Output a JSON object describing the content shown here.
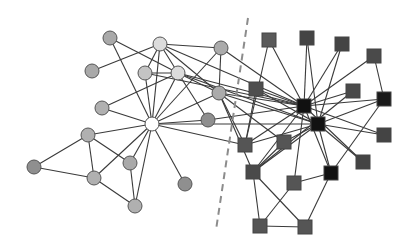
{
  "diagram": {
    "type": "network-graph",
    "width": 413,
    "height": 251,
    "divider": {
      "x1": 248,
      "y1": 18,
      "x2": 216,
      "y2": 230,
      "style": "dashed",
      "color": "#8c8c8c"
    },
    "groups": [
      {
        "name": "circle-group",
        "shape": "circle"
      },
      {
        "name": "square-group",
        "shape": "square"
      }
    ],
    "nodes": [
      {
        "id": "C1",
        "shape": "circle",
        "x": 110,
        "y": 38,
        "r": 7,
        "fill": "#a9a9a9"
      },
      {
        "id": "C2",
        "shape": "circle",
        "x": 160,
        "y": 44,
        "r": 7,
        "fill": "#dcdcdc"
      },
      {
        "id": "C3",
        "shape": "circle",
        "x": 92,
        "y": 71,
        "r": 7,
        "fill": "#a9a9a9"
      },
      {
        "id": "C4",
        "shape": "circle",
        "x": 145,
        "y": 73,
        "r": 7,
        "fill": "#c4c4c4"
      },
      {
        "id": "C5",
        "shape": "circle",
        "x": 178,
        "y": 73,
        "r": 7,
        "fill": "#dcdcdc"
      },
      {
        "id": "C6",
        "shape": "circle",
        "x": 221,
        "y": 48,
        "r": 7,
        "fill": "#ababab"
      },
      {
        "id": "C7",
        "shape": "circle",
        "x": 102,
        "y": 108,
        "r": 7,
        "fill": "#b0b0b0"
      },
      {
        "id": "C8",
        "shape": "circle",
        "x": 152,
        "y": 124,
        "r": 7,
        "fill": "#ffffff"
      },
      {
        "id": "C9",
        "shape": "circle",
        "x": 208,
        "y": 120,
        "r": 7,
        "fill": "#8f8f8f"
      },
      {
        "id": "C10",
        "shape": "circle",
        "x": 219,
        "y": 93,
        "r": 7,
        "fill": "#ababab"
      },
      {
        "id": "C11",
        "shape": "circle",
        "x": 88,
        "y": 135,
        "r": 7,
        "fill": "#b0b0b0"
      },
      {
        "id": "C12",
        "shape": "circle",
        "x": 34,
        "y": 167,
        "r": 7,
        "fill": "#8f8f8f"
      },
      {
        "id": "C13",
        "shape": "circle",
        "x": 94,
        "y": 178,
        "r": 7,
        "fill": "#b0b0b0"
      },
      {
        "id": "C14",
        "shape": "circle",
        "x": 130,
        "y": 163,
        "r": 7,
        "fill": "#a9a9a9"
      },
      {
        "id": "C15",
        "shape": "circle",
        "x": 135,
        "y": 206,
        "r": 7,
        "fill": "#b0b0b0"
      },
      {
        "id": "C16",
        "shape": "circle",
        "x": 185,
        "y": 184,
        "r": 7,
        "fill": "#8f8f8f"
      },
      {
        "id": "S1",
        "shape": "square",
        "x": 269,
        "y": 40,
        "s": 14,
        "fill": "#5a5a5a"
      },
      {
        "id": "S2",
        "shape": "square",
        "x": 307,
        "y": 38,
        "s": 14,
        "fill": "#444444"
      },
      {
        "id": "S3",
        "shape": "square",
        "x": 342,
        "y": 44,
        "s": 14,
        "fill": "#444444"
      },
      {
        "id": "S4",
        "shape": "square",
        "x": 374,
        "y": 56,
        "s": 14,
        "fill": "#4a4a4a"
      },
      {
        "id": "S5",
        "shape": "square",
        "x": 256,
        "y": 89,
        "s": 14,
        "fill": "#4e4e4e"
      },
      {
        "id": "S6",
        "shape": "square",
        "x": 304,
        "y": 106,
        "s": 14,
        "fill": "#111111"
      },
      {
        "id": "S7",
        "shape": "square",
        "x": 318,
        "y": 124,
        "s": 14,
        "fill": "#111111"
      },
      {
        "id": "S8",
        "shape": "square",
        "x": 353,
        "y": 91,
        "s": 14,
        "fill": "#4a4a4a"
      },
      {
        "id": "S9",
        "shape": "square",
        "x": 384,
        "y": 99,
        "s": 14,
        "fill": "#1a1a1a"
      },
      {
        "id": "S10",
        "shape": "square",
        "x": 245,
        "y": 145,
        "s": 14,
        "fill": "#555555"
      },
      {
        "id": "S11",
        "shape": "square",
        "x": 284,
        "y": 142,
        "s": 14,
        "fill": "#555555"
      },
      {
        "id": "S12",
        "shape": "square",
        "x": 384,
        "y": 135,
        "s": 14,
        "fill": "#444444"
      },
      {
        "id": "S13",
        "shape": "square",
        "x": 363,
        "y": 162,
        "s": 14,
        "fill": "#444444"
      },
      {
        "id": "S14",
        "shape": "square",
        "x": 253,
        "y": 172,
        "s": 14,
        "fill": "#4a4a4a"
      },
      {
        "id": "S15",
        "shape": "square",
        "x": 294,
        "y": 183,
        "s": 14,
        "fill": "#555555"
      },
      {
        "id": "S16",
        "shape": "square",
        "x": 331,
        "y": 173,
        "s": 14,
        "fill": "#111111"
      },
      {
        "id": "S17",
        "shape": "square",
        "x": 260,
        "y": 226,
        "s": 14,
        "fill": "#555555"
      },
      {
        "id": "S18",
        "shape": "square",
        "x": 305,
        "y": 227,
        "s": 14,
        "fill": "#555555"
      }
    ],
    "edges": [
      [
        "C1",
        "C8"
      ],
      [
        "C1",
        "C5"
      ],
      [
        "C3",
        "C2"
      ],
      [
        "C7",
        "C5"
      ],
      [
        "C7",
        "C8"
      ],
      [
        "C2",
        "C4"
      ],
      [
        "C2",
        "C5"
      ],
      [
        "C2",
        "C8"
      ],
      [
        "C2",
        "C6"
      ],
      [
        "C2",
        "C10"
      ],
      [
        "C2",
        "S6"
      ],
      [
        "C4",
        "C5"
      ],
      [
        "C4",
        "C8"
      ],
      [
        "C4",
        "S6"
      ],
      [
        "C5",
        "C8"
      ],
      [
        "C5",
        "C10"
      ],
      [
        "C5",
        "S6"
      ],
      [
        "C5",
        "S7"
      ],
      [
        "C5",
        "C9"
      ],
      [
        "C6",
        "C8"
      ],
      [
        "C6",
        "C10"
      ],
      [
        "C6",
        "S6"
      ],
      [
        "C10",
        "C8"
      ],
      [
        "C10",
        "S6"
      ],
      [
        "C10",
        "S7"
      ],
      [
        "C10",
        "S10"
      ],
      [
        "C10",
        "S14"
      ],
      [
        "C10",
        "S11"
      ],
      [
        "C9",
        "C8"
      ],
      [
        "C9",
        "S6"
      ],
      [
        "C8",
        "C11"
      ],
      [
        "C8",
        "C14"
      ],
      [
        "C8",
        "C13"
      ],
      [
        "C8",
        "C15"
      ],
      [
        "C8",
        "C16"
      ],
      [
        "C8",
        "S10"
      ],
      [
        "C8",
        "S7"
      ],
      [
        "C11",
        "C12"
      ],
      [
        "C11",
        "C13"
      ],
      [
        "C11",
        "C14"
      ],
      [
        "C12",
        "C13"
      ],
      [
        "C13",
        "C15"
      ],
      [
        "C14",
        "C15"
      ],
      [
        "S1",
        "S6"
      ],
      [
        "S1",
        "S10"
      ],
      [
        "S2",
        "S6"
      ],
      [
        "S2",
        "S7"
      ],
      [
        "S3",
        "S6"
      ],
      [
        "S3",
        "S7"
      ],
      [
        "S4",
        "S6"
      ],
      [
        "S4",
        "S9"
      ],
      [
        "S5",
        "S6"
      ],
      [
        "S5",
        "S10"
      ],
      [
        "S8",
        "S6"
      ],
      [
        "S9",
        "S6"
      ],
      [
        "S9",
        "S7"
      ],
      [
        "S9",
        "S16"
      ],
      [
        "S6",
        "S14"
      ],
      [
        "S7",
        "S14"
      ],
      [
        "S7",
        "S12"
      ],
      [
        "S7",
        "S13"
      ],
      [
        "S7",
        "S16"
      ],
      [
        "S6",
        "S12"
      ],
      [
        "S7",
        "S11"
      ],
      [
        "S6",
        "S13"
      ],
      [
        "S6",
        "S16"
      ],
      [
        "S6",
        "S15"
      ],
      [
        "S7",
        "S10"
      ],
      [
        "S8",
        "S14"
      ],
      [
        "S11",
        "S14"
      ],
      [
        "S14",
        "S17"
      ],
      [
        "S14",
        "S18"
      ],
      [
        "S15",
        "S17"
      ],
      [
        "S15",
        "S16"
      ],
      [
        "S16",
        "S18"
      ],
      [
        "S17",
        "S18"
      ],
      [
        "S10",
        "S6"
      ],
      [
        "S5",
        "S7"
      ]
    ]
  }
}
